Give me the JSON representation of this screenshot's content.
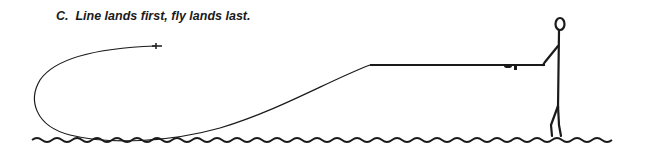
{
  "caption": "C.  Line lands first, fly lands last.",
  "illustration": {
    "subject": "stick-figure-angler",
    "elements": [
      "fly-line-loop",
      "fly",
      "fly-rod",
      "reel",
      "angler",
      "water-surface"
    ]
  },
  "colors": {
    "ink": "#1a1a1a",
    "background": "#ffffff"
  }
}
